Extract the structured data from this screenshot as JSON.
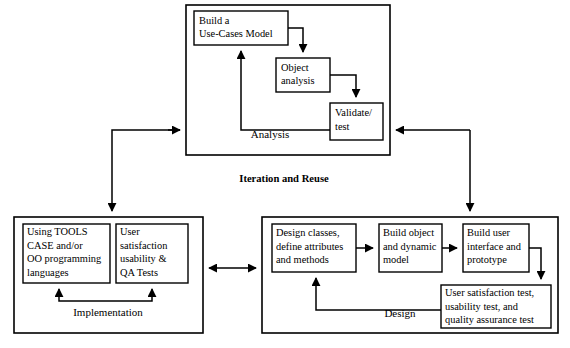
{
  "diagram": {
    "title": "Iteration and Reuse",
    "groups": [
      {
        "id": "analysis",
        "label": "Analysis",
        "nodes": [
          {
            "id": "build-use-cases-model",
            "lines": [
              "Build a",
              "Use-Cases Model"
            ]
          },
          {
            "id": "object-analysis",
            "lines": [
              "Object",
              "analysis"
            ]
          },
          {
            "id": "validate-test",
            "lines": [
              "Validate/",
              "test"
            ]
          }
        ]
      },
      {
        "id": "implementation",
        "label": "Implementation",
        "nodes": [
          {
            "id": "using-tools",
            "lines": [
              "Using TOOLS",
              "CASE and/or",
              "OO programming",
              "languages"
            ]
          },
          {
            "id": "user-satisfaction-qa",
            "lines": [
              "User",
              "satisfaction",
              "usability &",
              "QA Tests"
            ]
          }
        ]
      },
      {
        "id": "design",
        "label": "Design",
        "nodes": [
          {
            "id": "design-classes",
            "lines": [
              "Design classes,",
              "define attributes",
              "and methods"
            ]
          },
          {
            "id": "build-object-model",
            "lines": [
              "Build object",
              "and dynamic",
              "model"
            ]
          },
          {
            "id": "build-user-interface",
            "lines": [
              "Build user",
              "interface and",
              "prototype"
            ]
          },
          {
            "id": "user-satisfaction-test",
            "lines": [
              "User satisfaction test,",
              "usability test, and",
              "quality assurance test"
            ]
          }
        ]
      }
    ],
    "colors": {
      "stroke": "#000000",
      "background": "#ffffff",
      "text": "#000000"
    }
  }
}
